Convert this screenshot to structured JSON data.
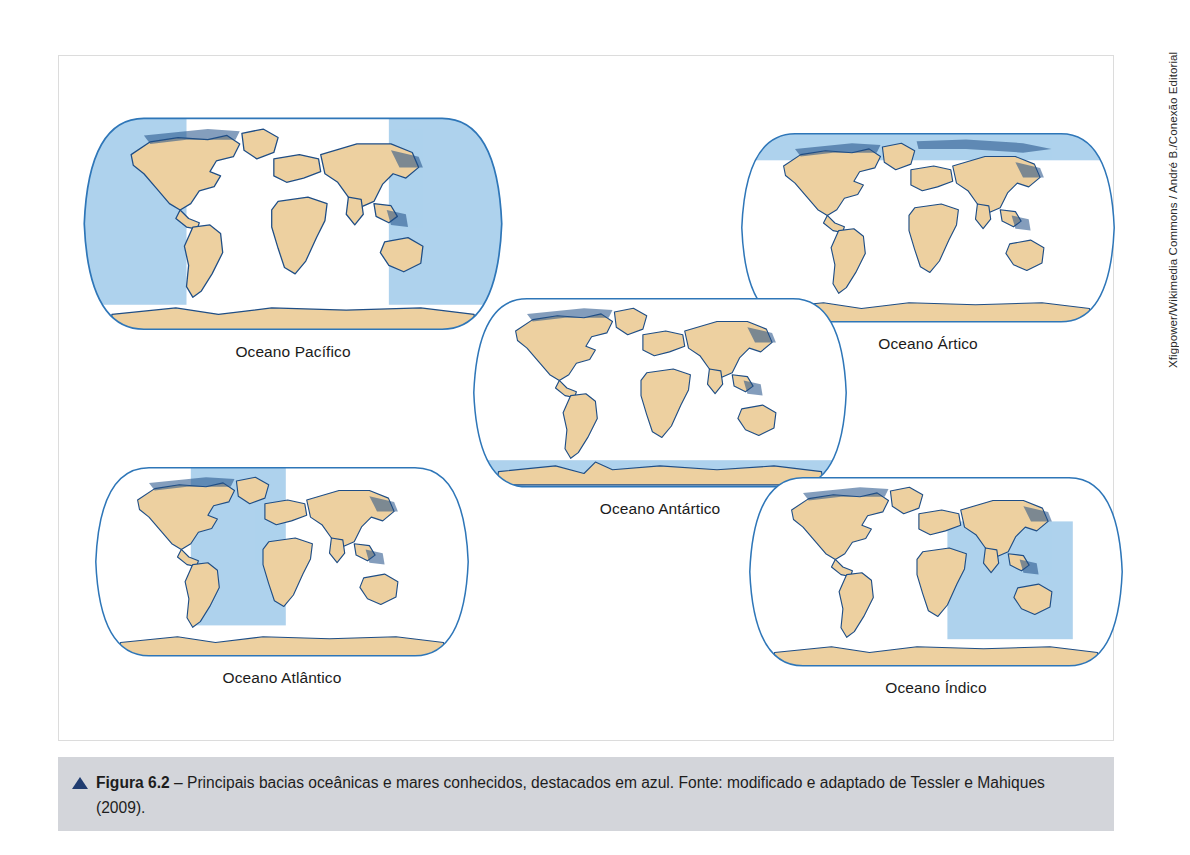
{
  "figure": {
    "credit": "Xfigpower/Wikimedia Commons / André B./Conexão Editorial",
    "caption": {
      "marker_icon": "triangle-up-icon",
      "label": "Figura 6.2",
      "text": " – Principais bacias oceânicas e mares conhecidos, destacados em azul. Fonte: modificado e adaptado de Tessler e Mahiques (2009)."
    },
    "colors": {
      "land": "#edd0a0",
      "land_stroke": "#1f4e86",
      "ocean": "#ffffff",
      "highlight_blue": "#aed2ed",
      "globe_outline": "#2e76b8",
      "caption_bar": "#d3d5da",
      "caption_marker": "#1f3c70",
      "frame_border": "#dcdcdc"
    },
    "maps": [
      {
        "id": "pacifico",
        "label": "Oceano Pacífico",
        "highlight_region": "Pacific Ocean - eastern and western edges of Robinson projection",
        "projection": "robinson"
      },
      {
        "id": "artico",
        "label": "Oceano Ártico",
        "highlight_region": "Arctic Ocean - northern polar band",
        "projection": "robinson"
      },
      {
        "id": "antartico",
        "label": "Oceano Antártico",
        "highlight_region": "Southern Ocean - southern polar band",
        "projection": "robinson"
      },
      {
        "id": "atlantico",
        "label": "Oceano Atlântico",
        "highlight_region": "Atlantic Ocean - central basin between Americas and Africa/Europe",
        "projection": "robinson"
      },
      {
        "id": "indico",
        "label": "Oceano Índico",
        "highlight_region": "Indian Ocean - between Africa, Asia and Australia",
        "projection": "robinson"
      }
    ]
  }
}
